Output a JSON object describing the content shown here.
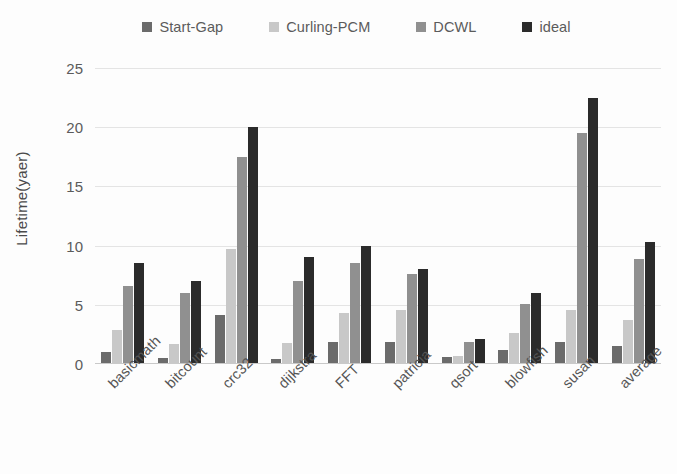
{
  "chart_data": {
    "type": "bar",
    "title": "",
    "subtitle": "",
    "xlabel": "",
    "ylabel": "Lifetime(yaer)",
    "ylim": [
      0,
      25
    ],
    "y_ticks": [
      0,
      5,
      10,
      15,
      20,
      25
    ],
    "grid": true,
    "legend_position": "top",
    "categories": [
      "basicmath",
      "bitcount",
      "crc32",
      "dijkstra",
      "FFT",
      "patricia",
      "qsort",
      "blowfish",
      "susan",
      "average"
    ],
    "series": [
      {
        "name": "Start-Gap",
        "color": "#6b6b6b",
        "values": [
          1.0,
          0.5,
          4.1,
          0.4,
          1.9,
          1.9,
          0.6,
          1.2,
          1.9,
          1.5
        ]
      },
      {
        "name": "Curling-PCM",
        "color": "#c8c8c8",
        "values": [
          2.9,
          1.7,
          9.7,
          1.8,
          4.3,
          4.6,
          0.7,
          2.6,
          4.6,
          3.7
        ]
      },
      {
        "name": "DCWL",
        "color": "#909090",
        "values": [
          6.6,
          6.0,
          17.5,
          7.0,
          8.5,
          7.6,
          1.9,
          5.1,
          19.5,
          8.9
        ]
      },
      {
        "name": "ideal",
        "color": "#2b2b2b",
        "values": [
          8.5,
          7.0,
          20.0,
          9.0,
          10.0,
          8.0,
          2.1,
          6.0,
          22.5,
          10.3
        ]
      }
    ]
  }
}
